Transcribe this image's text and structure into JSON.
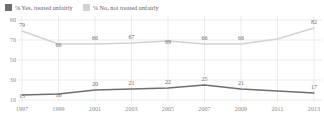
{
  "legend": {
    "items": [
      {
        "label": "% Yes, treated unfairly",
        "color": "#6e6e6e",
        "swatch_name": "legend-swatch-yes"
      },
      {
        "label": "% No, not treated unfairly",
        "color": "#d2d2d2",
        "swatch_name": "legend-swatch-no"
      }
    ]
  },
  "axis": {
    "y_ticks": [
      "90",
      "70",
      "50",
      "30",
      "10"
    ],
    "x_ticks": [
      "1997",
      "1999",
      "2001",
      "2003",
      "2005",
      "2007",
      "2009",
      "2011",
      "2013"
    ]
  },
  "chart_data": {
    "type": "line",
    "title": "",
    "subtitle": "",
    "xlabel": "",
    "ylabel": "",
    "x": [
      1997,
      1999,
      2001,
      2003,
      2005,
      2007,
      2009,
      2011,
      2013
    ],
    "categories": [
      "1997",
      "1999",
      "2001",
      "2003",
      "2005",
      "2007",
      "2009",
      "2011",
      "2013"
    ],
    "ylim": [
      10,
      90
    ],
    "ytick_values": [
      90,
      70,
      50,
      30,
      10
    ],
    "grid": true,
    "grid_axes": "both",
    "legend_position": "top-left",
    "series": [
      {
        "name": "% No, not treated unfairly",
        "color": "#d2d2d2",
        "values": [
          79,
          66,
          66,
          67,
          69,
          66,
          66,
          71,
          82
        ],
        "labels": [
          "79",
          "66",
          "66",
          "67",
          "69",
          "66",
          "66",
          "",
          "82"
        ],
        "label_offsets_y": [
          -9,
          -2,
          -9,
          -9,
          -2,
          -9,
          -9,
          0,
          -9
        ]
      },
      {
        "name": "% Yes, treated unfairly",
        "color": "#6e6e6e",
        "values": [
          15,
          16,
          20,
          21,
          22,
          25,
          21,
          19,
          17
        ],
        "labels": [
          "15",
          "16",
          "20",
          "21",
          "22",
          "25",
          "21",
          "",
          "17"
        ],
        "label_offsets_y": [
          -2,
          -2,
          -9,
          -9,
          -9,
          -9,
          -9,
          0,
          -9
        ]
      }
    ]
  },
  "style": {
    "grid_color": "#e2e2e2",
    "axis_color": "#d8d8d8",
    "background": "#ffffff",
    "tick_label_color": "#8a8a8a"
  }
}
